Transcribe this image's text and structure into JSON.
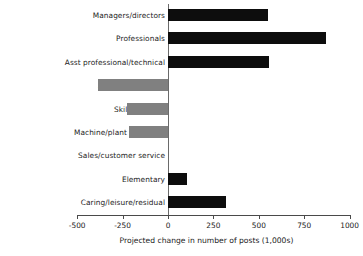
{
  "chart_data": {
    "type": "bar",
    "orientation": "horizontal",
    "title": "",
    "subtitle": "",
    "xlabel": "Projected change in number of posts (1,000s)",
    "ylabel": "",
    "xlim": [
      -500,
      1000
    ],
    "ylim": null,
    "grid": false,
    "legend": null,
    "xticks": [
      -500,
      -250,
      0,
      250,
      500,
      750,
      1000
    ],
    "xticklabels": [
      "-500",
      "-250",
      "0",
      "250",
      "500",
      "750",
      "1000"
    ],
    "categories": [
      "Managers/directors",
      "Professionals",
      "Asst professional/technical",
      "Admin/Secretarial",
      "Skilled trades",
      "Machine/plant operative",
      "Sales/customer service",
      "Elementary",
      "Caring/leisure/residual"
    ],
    "values": [
      550,
      870,
      555,
      -383,
      -228,
      -217,
      0,
      105,
      320
    ],
    "colors": {
      "positive": "#0d0d0d",
      "negative": "#808080",
      "axis": "#4a4a4a",
      "zero_line": "#6a6a6a",
      "text": "#1c1c1c",
      "background": "#ffffff"
    }
  }
}
